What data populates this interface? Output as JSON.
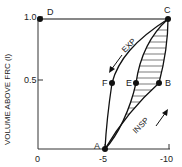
{
  "diagram": {
    "y_axis_label": "VOLUME ABOVE FRC (l)",
    "y_ticks": [
      "1.0",
      "0.5"
    ],
    "x_ticks": [
      "0",
      "-5",
      "-10"
    ],
    "points": {
      "A": "A",
      "B": "B",
      "C": "C",
      "D": "D",
      "E": "E",
      "F": "F"
    },
    "curve_labels": {
      "expiration": "EXP",
      "inspiration": "INSP"
    },
    "ink_color": "#111111"
  }
}
